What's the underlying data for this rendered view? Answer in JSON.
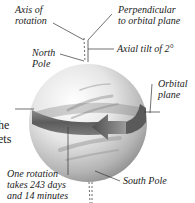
{
  "diagram": {
    "labels": {
      "axis_of_rotation": [
        "Axis of",
        "rotation"
      ],
      "perpendicular": [
        "Perpendicular",
        "to orbital plane"
      ],
      "axial_tilt": "Axial tilt of 2°",
      "north_pole": [
        "North",
        "Pole"
      ],
      "orbital_plane": [
        "Orbital",
        "plane"
      ],
      "one_rotation": [
        "One rotation",
        "takes 243 days",
        "and 14 minutes"
      ],
      "south_pole": "South Pole"
    },
    "cropped_text_fragments": [
      "he",
      "ets"
    ],
    "colors": {
      "planet_light": "#f2f2f2",
      "planet_shadow": "#8a8a8a",
      "arrow": "#6e6e6e",
      "text": "#222222"
    }
  }
}
